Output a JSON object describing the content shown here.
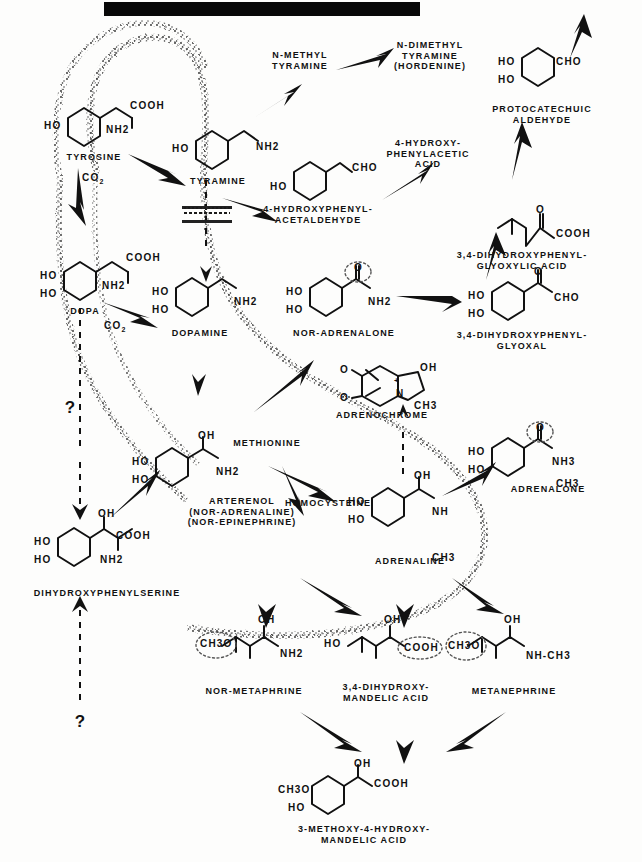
{
  "figure": {
    "type": "biochemical-pathway-diagram",
    "title_bar": "redacted-black-bar"
  },
  "compounds": {
    "tyrosine": "TYROSINE",
    "tyramine": "TYRAMINE",
    "n_methyl_tyramine": "N-METHYL\nTYRAMINE",
    "n_dimethyl_tyramine": "N-DIMETHYL\nTYRAMINE\n(HORDENINE)",
    "hydroxyphenylacetaldehyde": "4-HYDROXYPHENYL-\nACETALDEHYDE",
    "hydroxyphenylacetic_acid": "4-HYDROXY-\nPHENYLACETIC\nACID",
    "protocatechuic_aldehyde": "PROTOCATECHUIC\nALDEHYDE",
    "dopa": "DOPA",
    "dopamine": "DOPAMINE",
    "nor_adrenalone": "NOR-ADRENALONE",
    "dihydroxyphenyl_glyoxylic_acid": "3,4-DIHYDROXYPHENYL-\nGLYOXYLIC ACID",
    "dihydroxyphenyl_glyoxal": "3,4-DIHYDROXYPHENYL-\nGLYOXAL",
    "adrenochrome": "ADRENOCHROME",
    "adrenalone": "ADRENALONE",
    "arterenol": "ARTERENOL\n(NOR-ADRENALINE)\n(NOR-EPINEPHRINE)",
    "methionine": "METHIONINE",
    "homocysteine": "HOMOCYSTEINE",
    "adrenaline": "ADRENALINE",
    "dihydroxyphenylserine": "DIHYDROXYPHENYLSERINE",
    "nor_metaphrine": "NOR-METAPHRINE",
    "dihydroxymandelic_acid": "3,4-DIHYDROXY-\nMANDELIC ACID",
    "metanephrine": "METANEPHRINE",
    "methoxy_hydroxy_mandelic_acid": "3-METHOXY-4-HYDROXY-\nMANDELIC ACID"
  },
  "byproducts": {
    "co2_tyrosine": "CO2",
    "co2_dopa": "CO2"
  },
  "unknown_markers": {
    "q_left_upper": "?",
    "q_left_lower": "?"
  },
  "chemical_groups": {
    "ho": "HO",
    "cooh": "COOH",
    "nh2": "NH2",
    "nh": "NH",
    "nh3": "NH3",
    "cho": "CHO",
    "ch3": "CH3",
    "ch3o": "CH3O",
    "oh": "OH",
    "o": "O",
    "n": "N",
    "nh_ch3": "NH-CH3",
    "plus": "+"
  },
  "colors": {
    "ink": "#111111",
    "paper": "#fdfdfc",
    "membrane": "#2a2a2a",
    "redaction": "#080808"
  }
}
